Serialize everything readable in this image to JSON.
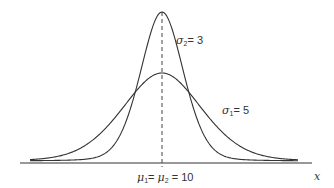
{
  "chart_data": {
    "type": "line",
    "title": "",
    "xlabel": "x",
    "ylabel": "",
    "grid": false,
    "legend": null,
    "annotations": [
      {
        "text": "σ2= 3",
        "symbol": "σ",
        "sub": "2",
        "value": "= 3",
        "target": "narrow curve"
      },
      {
        "text": "σ1= 5",
        "symbol": "σ",
        "sub": "1",
        "value": "= 5",
        "target": "wide curve"
      },
      {
        "text": "μ1= μ2 = 10",
        "target": "common mean, dashed vertical line"
      }
    ],
    "series": [
      {
        "name": "Normal, σ2 = 3",
        "mean": 10,
        "sd": 3,
        "color": "#333333"
      },
      {
        "name": "Normal, σ1 = 5",
        "mean": 10,
        "sd": 5,
        "color": "#333333"
      }
    ],
    "mean_line": {
      "x": 10,
      "style": "dashed"
    },
    "x_range_units": [
      -7,
      27
    ]
  },
  "labels": {
    "sigma2": {
      "symbol": "σ",
      "sub": "2",
      "rest": "= 3"
    },
    "sigma1": {
      "symbol": "σ",
      "sub": "1",
      "rest": "= 5"
    },
    "mu": {
      "symbol1": "μ",
      "sub1": "1",
      "mid": "= ",
      "symbol2": "μ",
      "sub2": "2",
      "rest": " = 10"
    },
    "x_axis": "x"
  },
  "colors": {
    "line": "#333333",
    "background": "#ffffff"
  }
}
